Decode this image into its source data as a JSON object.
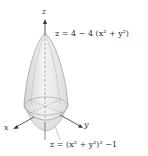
{
  "figure": {
    "type": "3d-surfaces-diagram",
    "axes": {
      "z_label": "z",
      "x_label": "x",
      "y_label": "y"
    },
    "surfaces": [
      {
        "name": "upper-paraboloid",
        "equation": "z = 4 − 4 (x² + y²)"
      },
      {
        "name": "lower-quartic",
        "equation": "z = (x² + y²)² −1"
      }
    ],
    "colors": {
      "surface_fill": "#e6e6e6",
      "surface_edge": "#9a9a9a",
      "axis": "#333333",
      "text": "#333333"
    }
  }
}
